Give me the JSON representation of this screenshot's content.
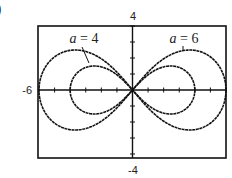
{
  "panel_label": ")",
  "chart_data": {
    "type": "line",
    "title": "",
    "xlabel": "",
    "ylabel": "",
    "xlim": [
      -6,
      6
    ],
    "ylim": [
      -4,
      4
    ],
    "x_tick_step": 1,
    "y_tick_step": 1,
    "grid": false,
    "edge_labels": {
      "top": "4",
      "bottom": "-4",
      "left": "-6"
    },
    "curve_equation": "r^2 = a^2 cos(2θ) (figure-eight through origin)",
    "series": [
      {
        "name": "a = 4",
        "a": 4,
        "label_var": "a",
        "label_eq": " = 4",
        "x_extent": [
          -4,
          4
        ],
        "max_height": 1.5
      },
      {
        "name": "a = 6",
        "a": 6,
        "label_var": "a",
        "label_eq": " = 6",
        "x_extent": [
          -6,
          6
        ],
        "max_height": 2.5
      }
    ],
    "annotations": [
      {
        "text": "a = 4",
        "points_to": "inner left lobe"
      },
      {
        "text": "a = 6",
        "points_to": "outer right lobe"
      }
    ],
    "legend": "none (inline labels)",
    "line_color": "#111111"
  }
}
